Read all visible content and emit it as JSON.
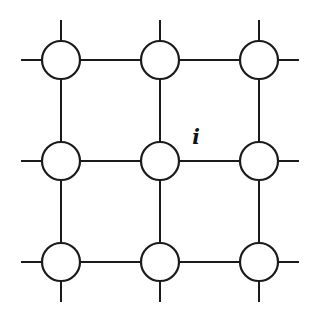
{
  "diagram": {
    "type": "lattice-grid",
    "rows": 3,
    "cols": 3,
    "xs": [
      61,
      160,
      259
    ],
    "ys": [
      60,
      161,
      262
    ],
    "node_radius": 19,
    "stub_length": 40,
    "label": {
      "text": "i",
      "x": 196,
      "y": 144
    },
    "colors": {
      "stroke": "#1a1a1a",
      "fill": "#ffffff",
      "background": "#ffffff"
    }
  }
}
